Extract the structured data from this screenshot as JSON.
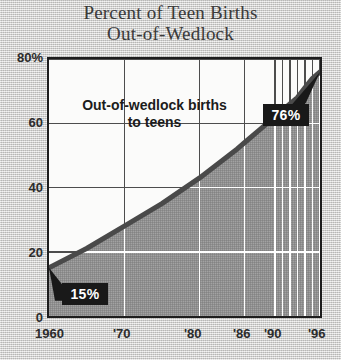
{
  "title": {
    "line1": "Percent of Teen Births",
    "line2": "Out-of-Wedlock"
  },
  "annotation": {
    "line1": "Out-of-wedlock births",
    "line2": "to teens"
  },
  "callouts": {
    "start": "15%",
    "end": "76%"
  },
  "axis": {
    "y_ticks": [
      "80%",
      "60",
      "40",
      "20",
      "0"
    ],
    "x_ticks": [
      "1960",
      "'70",
      "'80",
      "'86",
      "'90",
      "'96"
    ]
  },
  "colors": {
    "paper": "#d3d2d0",
    "plot_background": "#fbfbfa",
    "area_fill": "#8f8f8f",
    "line": "#4a4a4a",
    "grid_light": "#ffffff",
    "grid_dark": "#4d4d4d",
    "axis_border": "#1d1d1d",
    "callout_background": "#191919",
    "callout_text": "#ffffff",
    "title_text": "#3a3a3a"
  },
  "chart_data": {
    "type": "area",
    "title": "Percent of Teen Births Out-of-Wedlock",
    "subtitle": "",
    "xlabel": "",
    "ylabel": "Percent",
    "xlim": [
      1960,
      1996
    ],
    "ylim": [
      0,
      80
    ],
    "grid": true,
    "legend": "none",
    "y_tick_values": [
      0,
      20,
      40,
      60,
      80
    ],
    "y_tick_labels": [
      "0",
      "20",
      "40",
      "60",
      "80%"
    ],
    "x_tick_values": [
      1960,
      1970,
      1980,
      1986,
      1990,
      1996
    ],
    "x_tick_labels": [
      "1960",
      "'70",
      "'80",
      "'86",
      "'90",
      "'96"
    ],
    "x_minor_tick_values": [
      1990,
      1991,
      1992,
      1993,
      1994,
      1995,
      1996
    ],
    "series": [
      {
        "name": "Out-of-wedlock births to teens",
        "x": [
          1960,
          1965,
          1970,
          1975,
          1980,
          1985,
          1986,
          1988,
          1990,
          1991,
          1992,
          1993,
          1994,
          1995,
          1996
        ],
        "values": [
          15,
          21,
          28,
          35,
          43,
          52,
          54,
          58,
          62,
          64,
          66,
          68,
          71,
          74,
          76
        ]
      }
    ],
    "annotations": [
      {
        "text": "Out-of-wedlock births to teens",
        "type": "label"
      },
      {
        "text": "15%",
        "type": "callout",
        "x": 1960,
        "y": 15
      },
      {
        "text": "76%",
        "type": "callout",
        "x": 1996,
        "y": 76
      }
    ]
  }
}
